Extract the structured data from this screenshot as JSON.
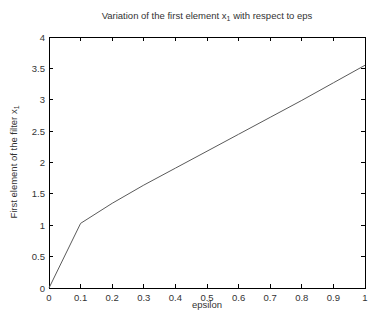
{
  "figure": {
    "title": {
      "prefix": "Variation of the first element x",
      "sub": "1",
      "suffix": " with respect to eps"
    },
    "xlabel": "epsilon",
    "ylabel": {
      "prefix": "First element of the filter x",
      "sub": "1"
    }
  },
  "chart_data": {
    "type": "line",
    "xlabel": "epsilon",
    "ylabel": "First element of the filter x_1",
    "x": [
      0,
      0.1,
      0.2,
      0.3,
      0.4,
      0.5,
      0.6,
      0.7,
      0.8,
      0.9,
      1
    ],
    "y": [
      0,
      1.03,
      1.35,
      1.64,
      1.91,
      2.18,
      2.45,
      2.72,
      2.99,
      3.27,
      3.55
    ],
    "xlim": [
      0,
      1
    ],
    "ylim": [
      0,
      4
    ],
    "xticks": [
      0,
      0.1,
      0.2,
      0.3,
      0.4,
      0.5,
      0.6,
      0.7,
      0.8,
      0.9,
      1
    ],
    "xtick_labels": [
      "0",
      "0.1",
      "0.2",
      "0.3",
      "0.4",
      "0.5",
      "0.6",
      "0.7",
      "0.8",
      "0.9",
      "1"
    ],
    "yticks": [
      0,
      0.5,
      1,
      1.5,
      2,
      2.5,
      3,
      3.5,
      4
    ],
    "ytick_labels": [
      "0",
      "0.5",
      "1",
      "1.5",
      "2",
      "2.5",
      "3",
      "3.5",
      "4"
    ],
    "grid": false,
    "legend": null,
    "line_color": "#5a5a5a",
    "axis_color": "#000000",
    "tick_label_color": "#333333",
    "background": "#ffffff"
  }
}
